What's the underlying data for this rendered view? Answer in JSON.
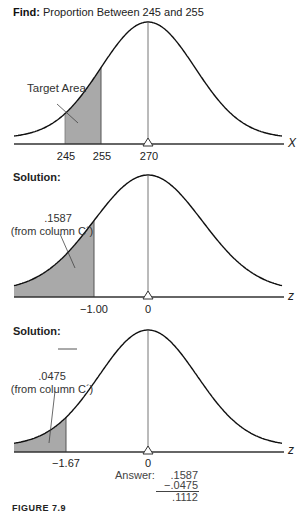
{
  "panel1": {
    "header_bold": "Find:",
    "header_text": "Proportion Between 245 and 255",
    "annotation": "Target Area",
    "ticks": [
      "245",
      "255",
      "270"
    ],
    "axis_label": "X"
  },
  "panel2": {
    "header": "Solution:",
    "annotation_value": ".1587",
    "annotation_source": "(from column C´)",
    "ticks": [
      "−1.00",
      "0"
    ],
    "axis_label": "z"
  },
  "panel3": {
    "header": "Solution:",
    "annotation_value": ".0475",
    "annotation_source": "(from column C´)",
    "ticks": [
      "−1.67",
      "0"
    ],
    "axis_label": "z"
  },
  "answer": {
    "label": "Answer:",
    "line1": ".1587",
    "line2": "−.0475",
    "result": ".1112"
  },
  "caption": "FIGURE 7.9",
  "colors": {
    "shade": "#a9a9a9",
    "curve": "#111111",
    "axis": "#333333"
  },
  "chart_data": [
    {
      "type": "area",
      "title": "Find: Proportion Between 245 and 255",
      "distribution": "normal",
      "mean": 270,
      "xlabel": "X",
      "tick_labels": [
        "245",
        "255",
        "270"
      ],
      "shaded_region": [
        245,
        255
      ],
      "annotation": "Target Area"
    },
    {
      "type": "area",
      "title": "Solution:",
      "distribution": "standard normal",
      "mean": 0,
      "xlabel": "z",
      "tick_labels": [
        "-1.00",
        "0"
      ],
      "shaded_region": [
        "-inf",
        -1.0
      ],
      "shaded_area": 0.1587,
      "annotation": ".1587 (from column C')"
    },
    {
      "type": "area",
      "title": "Solution:",
      "distribution": "standard normal",
      "mean": 0,
      "xlabel": "z",
      "tick_labels": [
        "-1.67",
        "0"
      ],
      "shaded_region": [
        "-inf",
        -1.67
      ],
      "shaded_area": 0.0475,
      "annotation": ".0475 (from column C')",
      "answer": {
        "minuend": 0.1587,
        "subtrahend": 0.0475,
        "result": 0.1112
      }
    }
  ]
}
